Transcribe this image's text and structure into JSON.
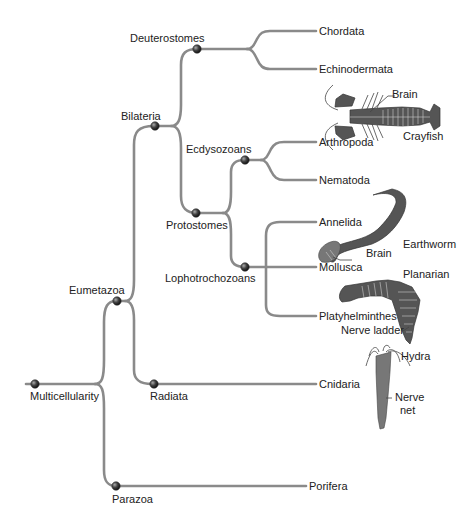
{
  "diagram": {
    "type": "phylogenetic-tree",
    "root": "Multicellularity",
    "internal_nodes": [
      {
        "id": "multicellularity",
        "label": "Multicellularity"
      },
      {
        "id": "eumetazoa",
        "label": "Eumetazoa"
      },
      {
        "id": "parazoa",
        "label": "Parazoa"
      },
      {
        "id": "bilateria",
        "label": "Bilateria"
      },
      {
        "id": "radiata",
        "label": "Radiata"
      },
      {
        "id": "deuterostomes",
        "label": "Deuterostomes"
      },
      {
        "id": "protostomes",
        "label": "Protostomes"
      },
      {
        "id": "ecdysozoans",
        "label": "Ecdysozoans"
      },
      {
        "id": "lophotrochozoans",
        "label": "Lophotrochozoans"
      }
    ],
    "tips": [
      {
        "label": "Chordata",
        "parent": "Deuterostomes"
      },
      {
        "label": "Echinodermata",
        "parent": "Deuterostomes"
      },
      {
        "label": "Arthropoda",
        "parent": "Ecdysozoans"
      },
      {
        "label": "Nematoda",
        "parent": "Ecdysozoans"
      },
      {
        "label": "Annelida",
        "parent": "Lophotrochozoans"
      },
      {
        "label": "Mollusca",
        "parent": "Lophotrochozoans"
      },
      {
        "label": "Platyhelminthes",
        "parent": "Lophotrochozoans"
      },
      {
        "label": "Cnidaria",
        "parent": "Radiata"
      },
      {
        "label": "Porifera",
        "parent": "Parazoa"
      }
    ],
    "illustrations": [
      {
        "animal": "Crayfish",
        "callouts": [
          "Brain"
        ]
      },
      {
        "animal": "Earthworm",
        "callouts": [
          "Brain"
        ]
      },
      {
        "animal": "Planarian",
        "callouts": [
          "Nerve ladder"
        ]
      },
      {
        "animal": "Hydra",
        "callouts": [
          "Nerve net"
        ]
      }
    ]
  },
  "labels": {
    "multicellularity": "Multicellularity",
    "eumetazoa": "Eumetazoa",
    "parazoa": "Parazoa",
    "bilateria": "Bilateria",
    "radiata": "Radiata",
    "deuterostomes": "Deuterostomes",
    "protostomes": "Protostomes",
    "ecdysozoans": "Ecdysozoans",
    "lophotrochozoans": "Lophotrochozoans",
    "chordata": "Chordata",
    "echinodermata": "Echinodermata",
    "arthropoda": "Arthropoda",
    "nematoda": "Nematoda",
    "annelida": "Annelida",
    "mollusca": "Mollusca",
    "platyhelminthes": "Platyhelminthes",
    "cnidaria": "Cnidaria",
    "porifera": "Porifera",
    "crayfish": "Crayfish",
    "crayfish_brain": "Brain",
    "earthworm": "Earthworm",
    "earthworm_brain": "Brain",
    "planarian": "Planarian",
    "nerve_ladder": "Nerve ladder",
    "hydra": "Hydra",
    "nerve_net_1": "Nerve",
    "nerve_net_2": "net"
  },
  "colors": {
    "branch": "#8a8a8a",
    "node": "#3a3a3a",
    "text": "#222222",
    "animal_fill": "#555555"
  }
}
